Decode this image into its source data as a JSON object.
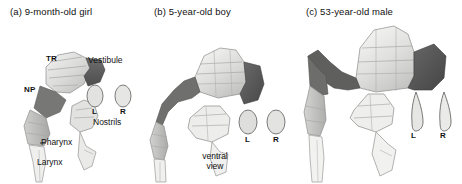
{
  "figure": {
    "type": "anatomical-3d-reconstruction-series",
    "background": "#ffffff",
    "ink": "#111111"
  },
  "panels": [
    {
      "id": "a",
      "title": "(a) 9-month-old  girl",
      "labels": {
        "tr": "TR",
        "vestibule": "Vestibule",
        "np": "NP",
        "nostril_left": "L",
        "nostril_right": "R",
        "nostrils": "Nostrils",
        "pharynx": "Pharynx",
        "larynx": "Larynx"
      },
      "nostril_shape": "oval"
    },
    {
      "id": "b",
      "title": "(b) 5-year-old boy",
      "labels": {
        "nostril_left": "L",
        "nostril_right": "R",
        "view_line1": "ventral",
        "view_line2": "view"
      },
      "nostril_shape": "oval"
    },
    {
      "id": "c",
      "title": "(c) 53-year-old male",
      "labels": {
        "nostril_left": "L",
        "nostril_right": "R"
      },
      "nostril_shape": "teardrop"
    }
  ],
  "colors": {
    "dark_segment": "#575757",
    "mid_segment": "#9a9a9a",
    "light_segment": "#d6d6d6",
    "pale_segment": "#ececeb",
    "outline": "#6f6f6f",
    "nostril_fill": "#e0e0e0",
    "nostril_stroke": "#6a6a6a"
  }
}
